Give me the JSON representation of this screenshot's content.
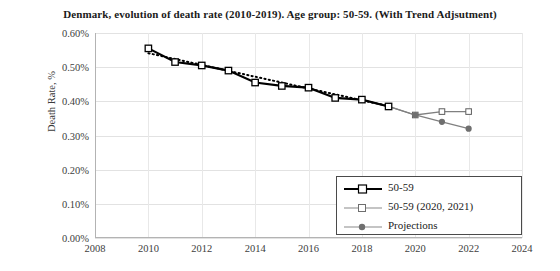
{
  "chart_data": {
    "type": "line",
    "title": "Denmark, evolution of death rate (2010-2019). Age group: 50-59. (With Trend Adjsutment)",
    "xlabel": "",
    "ylabel": "Death Rate, %",
    "xlim": [
      2008,
      2024
    ],
    "ylim": [
      0.0,
      0.6
    ],
    "xticks": [
      "2008",
      "2010",
      "2012",
      "2014",
      "2016",
      "2018",
      "2020",
      "2022",
      "2024"
    ],
    "xtick_values": [
      2008,
      2010,
      2012,
      2014,
      2016,
      2018,
      2020,
      2022,
      2024
    ],
    "yticks": [
      "0.00%",
      "0.10%",
      "0.20%",
      "0.30%",
      "0.40%",
      "0.50%",
      "0.60%"
    ],
    "ytick_values": [
      0.0,
      0.1,
      0.2,
      0.3,
      0.4,
      0.5,
      0.6
    ],
    "grid": true,
    "legend_position": "bottom-right",
    "series": [
      {
        "name": "50-59",
        "marker": "open-square",
        "color": "#000000",
        "style": "solid-thick",
        "x": [
          2010,
          2011,
          2012,
          2013,
          2014,
          2015,
          2016,
          2017,
          2018,
          2019
        ],
        "values": [
          0.555,
          0.515,
          0.505,
          0.49,
          0.455,
          0.445,
          0.44,
          0.41,
          0.405,
          0.385
        ]
      },
      {
        "name": "50-59 (2020, 2021)",
        "marker": "open-square",
        "color": "#808080",
        "style": "solid-thin",
        "x": [
          2019,
          2020,
          2021,
          2022
        ],
        "values": [
          0.385,
          0.36,
          0.37,
          0.37
        ]
      },
      {
        "name": "Projections",
        "marker": "filled-circle",
        "color": "#808080",
        "style": "solid-thin",
        "x": [
          2019,
          2020,
          2021,
          2022
        ],
        "values": [
          0.385,
          0.36,
          0.34,
          0.32
        ]
      },
      {
        "name": "Trend",
        "marker": "none",
        "color": "#000000",
        "style": "dotted",
        "x": [
          2010,
          2019
        ],
        "values": [
          0.541,
          0.386
        ]
      }
    ]
  },
  "legend": {
    "entries": [
      {
        "label": "50-59"
      },
      {
        "label": "50-59 (2020, 2021)"
      },
      {
        "label": "Projections"
      }
    ]
  }
}
